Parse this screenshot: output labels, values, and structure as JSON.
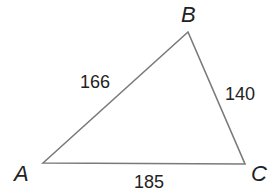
{
  "diagram": {
    "type": "triangle",
    "vertices": [
      {
        "name": "A",
        "x": 43,
        "y": 163,
        "label_x": 14,
        "label_y": 181
      },
      {
        "name": "B",
        "x": 188,
        "y": 32,
        "label_x": 181,
        "label_y": 22
      },
      {
        "name": "C",
        "x": 245,
        "y": 164,
        "label_x": 251,
        "label_y": 181
      }
    ],
    "sides": [
      {
        "between": "AB",
        "length": "166",
        "label_x": 80,
        "label_y": 88
      },
      {
        "between": "BC",
        "length": "140",
        "label_x": 225,
        "label_y": 100
      },
      {
        "between": "AC",
        "length": "185",
        "label_x": 134,
        "label_y": 188
      }
    ],
    "stroke_color": "#7a7a7a"
  }
}
